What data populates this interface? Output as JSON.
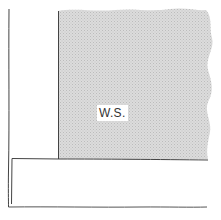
{
  "diagram": {
    "type": "schematic-sketch",
    "regions": [
      {
        "id": "ws-region",
        "label": "W.S.",
        "fill": "#d8d8d8",
        "pattern": "stipple",
        "edges": {
          "left": "straight",
          "top": "wavy",
          "right": "wavy",
          "bottom": "straight"
        }
      },
      {
        "id": "lower-band",
        "label": "",
        "fill": "#ffffff"
      },
      {
        "id": "left-column",
        "label": "",
        "fill": "#ffffff"
      }
    ],
    "colors": {
      "line": "#444444",
      "shade": "#d8d8d8",
      "shade_dot": "#bdbdbd",
      "background": "#ffffff"
    }
  },
  "labels": {
    "ws": "W.S."
  }
}
